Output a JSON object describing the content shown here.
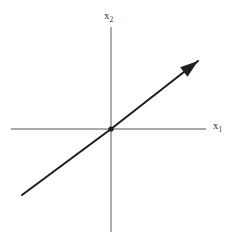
{
  "figure": {
    "name": "vector-line-plot",
    "background_color": "#ffffff",
    "width": 229,
    "height": 240
  },
  "axes": {
    "color": "#8c8c8c",
    "stroke_width": 1.4,
    "x_axis": {
      "label_base": "x",
      "label_sub": "1",
      "from": [
        11,
        129
      ],
      "to": [
        206,
        129
      ]
    },
    "y_axis": {
      "label_base": "x",
      "label_sub": "2",
      "from": [
        111,
        232
      ],
      "to": [
        111,
        27
      ]
    },
    "origin": [
      111,
      129
    ]
  },
  "chart_data": {
    "type": "line",
    "title": "",
    "xlabel": "x1",
    "ylabel": "x2",
    "grid": false,
    "legend": null,
    "axis_origin_px": [
      111,
      129
    ],
    "xlim_px": [
      11,
      206
    ],
    "ylim_px": [
      232,
      27
    ],
    "series": [
      {
        "name": "vector-direction-line",
        "color": "#231f1e",
        "stroke_width": 2.1,
        "arrow_at_end": true,
        "points_px": [
          [
            22,
            195
          ],
          [
            111,
            129
          ],
          [
            198,
            61
          ]
        ],
        "start_px": [
          22,
          195
        ],
        "end_px": [
          198,
          61
        ],
        "slope_px": -0.755,
        "passes_through_origin": true
      }
    ],
    "markers": [
      {
        "name": "origin-dot",
        "position_px": [
          111,
          129
        ],
        "radius_px": 2.6,
        "color": "#231f1e"
      }
    ],
    "annotations": [
      {
        "name": "y-axis-label",
        "text": "x2",
        "position_px": [
          104,
          19
        ]
      },
      {
        "name": "x-axis-label",
        "text": "x1",
        "position_px": [
          213,
          129
        ]
      }
    ]
  },
  "vector": {
    "color": "#231f1e",
    "arrowhead": {
      "name": "arrowhead",
      "tip_px": [
        198,
        61
      ],
      "length_px": 18,
      "half_width_px": 6,
      "filled": true
    }
  }
}
